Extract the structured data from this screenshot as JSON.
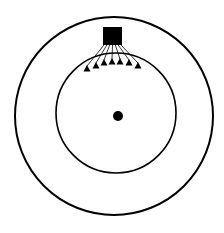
{
  "diagram": {
    "colors": {
      "stroke": "#000000",
      "fill": "#000000",
      "background": "#ffffff"
    },
    "outer_circle": {
      "cx": 114,
      "cy": 116,
      "r": 99
    },
    "inner_circle": {
      "cx": 116,
      "cy": 113,
      "r": 60
    },
    "center_dot": {
      "cx": 118,
      "cy": 116,
      "r": 5
    },
    "square": {
      "x": 103,
      "y": 27,
      "w": 19,
      "h": 18
    },
    "triangles": [
      {
        "x": 87,
        "y": 70
      },
      {
        "x": 96,
        "y": 67
      },
      {
        "x": 104,
        "y": 64
      },
      {
        "x": 112,
        "y": 63
      },
      {
        "x": 120,
        "y": 63
      },
      {
        "x": 129,
        "y": 64
      },
      {
        "x": 138,
        "y": 67
      }
    ]
  }
}
